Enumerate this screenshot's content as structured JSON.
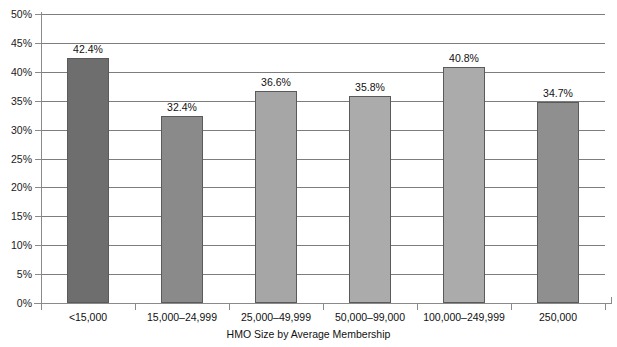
{
  "chart_data": {
    "type": "bar",
    "title": "",
    "subtitle": "",
    "xlabel": "HMO Size by Average Membership",
    "ylabel": "",
    "categories": [
      "<15,000",
      "15,000–24,999",
      "25,000–49,999",
      "50,000–99,000",
      "100,000–249,999",
      "250,000"
    ],
    "values": [
      42.4,
      32.4,
      36.6,
      35.8,
      40.8,
      34.7
    ],
    "value_labels": [
      "42.4%",
      "32.4%",
      "36.6%",
      "35.8%",
      "40.8%",
      "34.7%"
    ],
    "bar_colors": [
      "#6e6e6e",
      "#8a8a8a",
      "#a6a6a6",
      "#ababab",
      "#ababab",
      "#8f8f8f"
    ],
    "ylim": [
      0,
      50
    ],
    "ytick_values": [
      0,
      5,
      10,
      15,
      20,
      25,
      30,
      35,
      40,
      45,
      50
    ],
    "ytick_labels": [
      "0%",
      "5%",
      "10%",
      "15%",
      "20%",
      "25%",
      "30%",
      "35%",
      "40%",
      "45%",
      "50%"
    ],
    "grid": true,
    "grid_axis": "y",
    "legend": false,
    "legend_position": "none",
    "axis_color": "#8a8a8a",
    "grid_color": "#7d7d7d",
    "background": "#ffffff",
    "bar_border_color": "#5a5a5a"
  }
}
